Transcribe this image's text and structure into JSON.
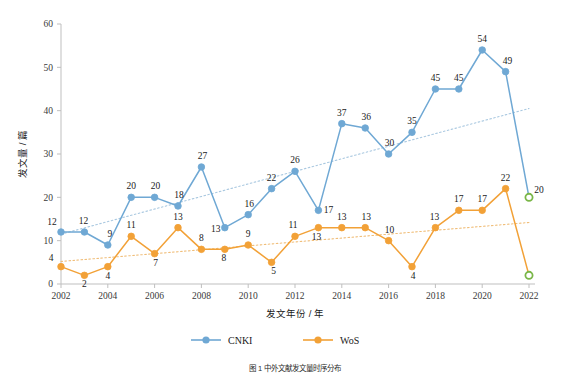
{
  "chart_data": {
    "type": "line",
    "title": "",
    "xlabel": "发文年份 / 年",
    "ylabel": "发文量 / 篇",
    "x": [
      2002,
      2003,
      2004,
      2005,
      2006,
      2007,
      2008,
      2009,
      2010,
      2011,
      2012,
      2013,
      2014,
      2015,
      2016,
      2017,
      2018,
      2019,
      2020,
      2021,
      2022
    ],
    "xtick_labels": [
      "2002",
      "2004",
      "2006",
      "2008",
      "2010",
      "2012",
      "2014",
      "2016",
      "2018",
      "2020",
      "2022"
    ],
    "xtick_values": [
      2002,
      2004,
      2006,
      2008,
      2010,
      2012,
      2014,
      2016,
      2018,
      2020,
      2022
    ],
    "ytick_labels": [
      "0",
      "10",
      "20",
      "30",
      "40",
      "50",
      "60"
    ],
    "ytick_values": [
      0,
      10,
      20,
      30,
      40,
      50,
      60
    ],
    "ylim": [
      0,
      60
    ],
    "xlim": [
      2002,
      2022
    ],
    "grid": false,
    "legend_position": "bottom",
    "series": [
      {
        "name": "CNKI",
        "color": "#6FA8D4",
        "marker": "circle",
        "values": [
          12,
          12,
          9,
          20,
          20,
          18,
          27,
          13,
          16,
          22,
          26,
          17,
          37,
          36,
          30,
          35,
          45,
          45,
          54,
          49,
          20
        ],
        "labels": [
          "12",
          "12",
          "9",
          "20",
          "20",
          "18",
          "27",
          "13",
          "16",
          "22",
          "26",
          "17",
          "37",
          "36",
          "30",
          "35",
          "45",
          "45",
          "54",
          "49",
          "20"
        ],
        "trendline": {
          "type": "linear",
          "style": "dotted",
          "color": "#A9C8E0",
          "y_start": 11.5,
          "y_end": 40.5
        }
      },
      {
        "name": "WoS",
        "color": "#F2A137",
        "marker": "circle",
        "values": [
          4,
          2,
          4,
          11,
          7,
          13,
          8,
          8,
          9,
          5,
          11,
          13,
          13,
          13,
          10,
          4,
          13,
          17,
          17,
          22,
          2
        ],
        "labels": [
          "4",
          "2",
          "4",
          "11",
          "7",
          "13",
          "8",
          "8",
          "9",
          "5",
          "11",
          "13",
          "13",
          "13",
          "10",
          "4",
          "13",
          "17",
          "17",
          "22",
          ""
        ],
        "trendline": {
          "type": "linear",
          "style": "dotted",
          "color": "#F0BE7A",
          "y_start": 5.2,
          "y_end": 14.2
        }
      }
    ],
    "highlight_points": [
      {
        "series": "CNKI",
        "x": 2022,
        "y": 20,
        "style": "hollow",
        "color": "#7AB648"
      },
      {
        "series": "WoS",
        "x": 2022,
        "y": 2,
        "style": "hollow",
        "color": "#7AB648"
      }
    ]
  },
  "legend": {
    "items": [
      {
        "label": "CNKI",
        "color": "#6FA8D4"
      },
      {
        "label": "WoS",
        "color": "#F2A137"
      }
    ]
  },
  "caption": {
    "text": "图 1  中外文献发文量时序分布"
  }
}
